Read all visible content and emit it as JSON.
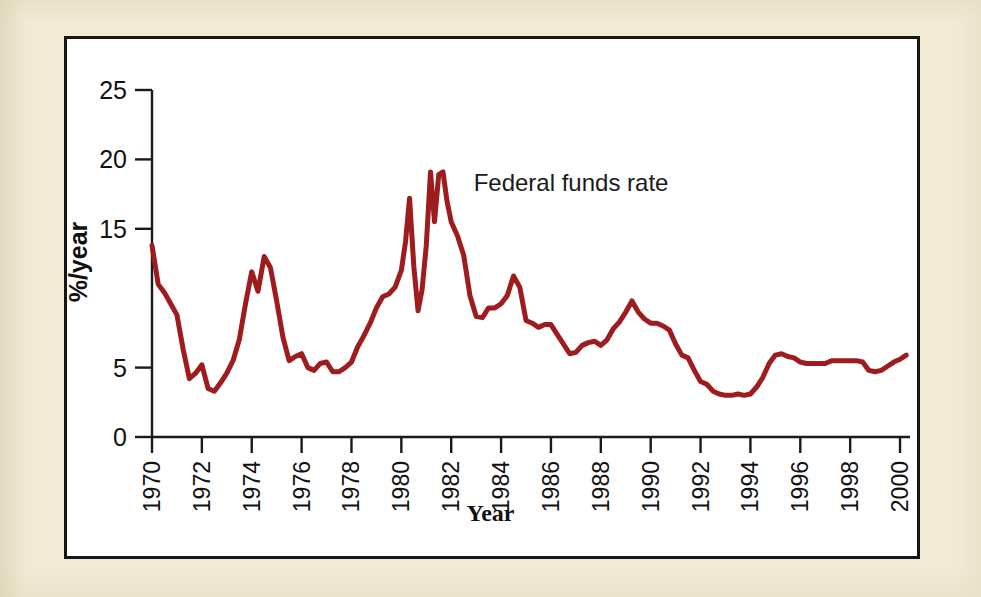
{
  "figure": {
    "background_color": "#f1ead4",
    "plot_background_color": "#ffffff",
    "frame_color": "#161616"
  },
  "chart_data": {
    "type": "line",
    "title": "",
    "subtitle": "",
    "xlabel": "Year",
    "ylabel": "%/year",
    "series_label": "Federal funds rate",
    "line_color": "#9e1b1e",
    "line_width": 5,
    "grid": false,
    "legend_position": "inline-annotation",
    "annotation": {
      "text": "Federal funds rate",
      "x_year": 1982.9,
      "y_value": 18.3
    },
    "xlim": [
      1970,
      2000.4
    ],
    "ylim": [
      0,
      25
    ],
    "xticks": [
      1970,
      1972,
      1974,
      1976,
      1978,
      1980,
      1982,
      1984,
      1986,
      1988,
      1990,
      1992,
      1994,
      1996,
      1998,
      2000
    ],
    "xticklabels": [
      "1970",
      "1972",
      "1974",
      "1976",
      "1978",
      "1980",
      "1982",
      "1984",
      "1986",
      "1988",
      "1990",
      "1992",
      "1994",
      "1996",
      "1998",
      "2000"
    ],
    "yticks": [
      0,
      5,
      15,
      20,
      25
    ],
    "yticklabels": [
      "0",
      "5",
      "15",
      "20",
      "25"
    ],
    "x": [
      1970.0,
      1970.25,
      1970.5,
      1970.75,
      1971.0,
      1971.25,
      1971.5,
      1971.75,
      1972.0,
      1972.25,
      1972.5,
      1972.75,
      1973.0,
      1973.25,
      1973.5,
      1973.75,
      1974.0,
      1974.25,
      1974.5,
      1974.75,
      1975.0,
      1975.25,
      1975.5,
      1975.75,
      1976.0,
      1976.25,
      1976.5,
      1976.75,
      1977.0,
      1977.25,
      1977.5,
      1977.75,
      1978.0,
      1978.25,
      1978.5,
      1978.75,
      1979.0,
      1979.25,
      1979.5,
      1979.75,
      1980.0,
      1980.17,
      1980.33,
      1980.5,
      1980.67,
      1980.83,
      1981.0,
      1981.17,
      1981.33,
      1981.5,
      1981.67,
      1981.83,
      1982.0,
      1982.25,
      1982.5,
      1982.75,
      1983.0,
      1983.25,
      1983.5,
      1983.75,
      1984.0,
      1984.25,
      1984.5,
      1984.75,
      1985.0,
      1985.25,
      1985.5,
      1985.75,
      1986.0,
      1986.25,
      1986.5,
      1986.75,
      1987.0,
      1987.25,
      1987.5,
      1987.75,
      1988.0,
      1988.25,
      1988.5,
      1988.75,
      1989.0,
      1989.25,
      1989.5,
      1989.75,
      1990.0,
      1990.25,
      1990.5,
      1990.75,
      1991.0,
      1991.25,
      1991.5,
      1991.75,
      1992.0,
      1992.25,
      1992.5,
      1992.75,
      1993.0,
      1993.25,
      1993.5,
      1993.75,
      1994.0,
      1994.25,
      1994.5,
      1994.75,
      1995.0,
      1995.25,
      1995.5,
      1995.75,
      1996.0,
      1996.25,
      1996.5,
      1996.75,
      1997.0,
      1997.25,
      1997.5,
      1997.75,
      1998.0,
      1998.25,
      1998.5,
      1998.75,
      1999.0,
      1999.25,
      1999.5,
      1999.75,
      2000.0,
      2000.25
    ],
    "y": [
      13.8,
      11.0,
      10.4,
      9.6,
      8.8,
      6.3,
      4.2,
      4.6,
      5.2,
      3.5,
      3.3,
      3.9,
      4.6,
      5.5,
      7.0,
      9.6,
      11.9,
      10.5,
      13.0,
      12.2,
      9.8,
      7.2,
      5.5,
      5.8,
      6.0,
      5.0,
      4.8,
      5.3,
      5.4,
      4.7,
      4.7,
      5.0,
      5.4,
      6.5,
      7.3,
      8.2,
      9.3,
      10.1,
      10.3,
      10.8,
      12.0,
      14.1,
      17.2,
      12.3,
      9.1,
      10.6,
      13.8,
      19.1,
      15.5,
      18.9,
      19.1,
      17.0,
      15.5,
      14.5,
      13.1,
      10.2,
      8.7,
      8.6,
      9.3,
      9.3,
      9.6,
      10.2,
      11.6,
      10.8,
      8.4,
      8.2,
      7.9,
      8.1,
      8.1,
      7.4,
      6.7,
      6.0,
      6.1,
      6.6,
      6.8,
      6.9,
      6.6,
      7.0,
      7.8,
      8.3,
      9.0,
      9.8,
      9.0,
      8.5,
      8.2,
      8.2,
      8.0,
      7.7,
      6.7,
      5.9,
      5.7,
      4.8,
      4.0,
      3.8,
      3.3,
      3.1,
      3.0,
      3.0,
      3.1,
      3.0,
      3.1,
      3.6,
      4.3,
      5.3,
      5.9,
      6.0,
      5.8,
      5.7,
      5.4,
      5.3,
      5.3,
      5.3,
      5.3,
      5.5,
      5.5,
      5.5,
      5.5,
      5.5,
      5.4,
      4.8,
      4.7,
      4.8,
      5.1,
      5.4,
      5.6,
      5.9
    ]
  },
  "axis": {
    "y_title": "%/year",
    "x_title": "Year"
  }
}
